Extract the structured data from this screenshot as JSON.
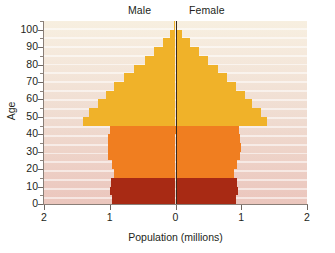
{
  "chart_data": {
    "type": "bar",
    "subtype": "population-pyramid",
    "title": "",
    "xlabel": "Population (millions)",
    "ylabel": "Age",
    "xlim": [
      -2,
      2
    ],
    "ylim": [
      0,
      105
    ],
    "xtick_labels": [
      "2",
      "1",
      "0",
      "1",
      "2"
    ],
    "xtick_values": [
      -2,
      -1,
      0,
      1,
      2
    ],
    "ytick_labels": [
      "0",
      "10",
      "20",
      "30",
      "40",
      "50",
      "60",
      "70",
      "80",
      "90",
      "100"
    ],
    "ytick_values": [
      0,
      10,
      20,
      30,
      40,
      50,
      60,
      70,
      80,
      90,
      100
    ],
    "ytick_minor_values": [
      5,
      15,
      25,
      35,
      45,
      55,
      65,
      75,
      85,
      95,
      105
    ],
    "grid": false,
    "legend_position": "top",
    "side_labels": {
      "left": "Male",
      "right": "Female"
    },
    "age_groups": [
      "0-4",
      "5-9",
      "10-14",
      "15-19",
      "20-24",
      "25-29",
      "30-34",
      "35-39",
      "40-44",
      "45-49",
      "50-54",
      "55-59",
      "60-64",
      "65-69",
      "70-74",
      "75-79",
      "80-84",
      "85-89",
      "90-94",
      "95-99",
      "100-104"
    ],
    "series": [
      {
        "name": "Male",
        "color": "#d9d9d9",
        "values": [
          0.96,
          0.99,
          0.98,
          0.93,
          0.97,
          1.02,
          1.03,
          1.02,
          1.0,
          1.4,
          1.31,
          1.18,
          1.06,
          0.93,
          0.78,
          0.63,
          0.47,
          0.32,
          0.19,
          0.08,
          0.02
        ]
      },
      {
        "name": "Female",
        "color": "#d9d9d9",
        "values": [
          0.92,
          0.95,
          0.94,
          0.89,
          0.93,
          0.98,
          0.99,
          0.98,
          0.97,
          1.39,
          1.3,
          1.17,
          1.05,
          0.92,
          0.78,
          0.64,
          0.5,
          0.35,
          0.22,
          0.1,
          0.03
        ]
      }
    ],
    "band_colors": {
      "youth": "#a82a14",
      "working": "#f07e20",
      "older": "#f0b229"
    },
    "band_ranges": {
      "youth": [
        0,
        15
      ],
      "working": [
        15,
        45
      ],
      "older": [
        45,
        105
      ]
    }
  },
  "axes": {
    "x_title": "Population (millions)",
    "y_title": "Age"
  },
  "labels": {
    "male": "Male",
    "female": "Female"
  }
}
